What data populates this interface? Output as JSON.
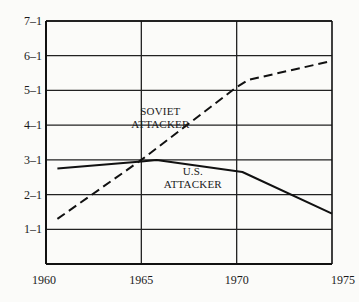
{
  "chart_data": {
    "type": "line",
    "title": "",
    "xlabel": "",
    "ylabel": "",
    "xlim": [
      1960,
      1975
    ],
    "ylim": [
      0,
      7
    ],
    "x_ticks": [
      "1960",
      "1965",
      "1970",
      "1975"
    ],
    "y_ticks": [
      "1–1",
      "2–1",
      "3–1",
      "4–1",
      "5–1",
      "6–1",
      "7–1"
    ],
    "grid": true,
    "series": [
      {
        "name": "SOVIET ATTACKER",
        "style": "dashed",
        "x": [
          1960.6,
          1965.0,
          1970.0,
          1970.6,
          1975.0
        ],
        "values": [
          1.3,
          3.0,
          5.1,
          5.3,
          5.85
        ]
      },
      {
        "name": "U.S. ATTACKER",
        "style": "solid",
        "x": [
          1960.6,
          1965.0,
          1965.8,
          1970.3,
          1975.0
        ],
        "values": [
          2.75,
          2.95,
          3.0,
          2.65,
          1.45
        ]
      }
    ],
    "annotations": [
      {
        "text": [
          "SOVIET",
          "ATTACKER"
        ],
        "x": 1966.0,
        "y": 4.3
      },
      {
        "text": [
          "U.S.",
          "ATTACKER"
        ],
        "x": 1967.7,
        "y": 2.55
      }
    ]
  }
}
